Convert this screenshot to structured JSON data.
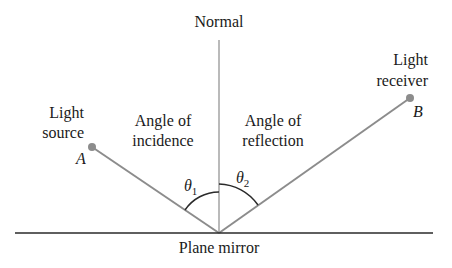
{
  "diagram": {
    "labels": {
      "normal": "Normal",
      "light_source_line1": "Light",
      "light_source_line2": "source",
      "point_a": "A",
      "angle_incidence_line1": "Angle of",
      "angle_incidence_line2": "incidence",
      "angle_reflection_line1": "Angle of",
      "angle_reflection_line2": "reflection",
      "light_receiver_line1": "Light",
      "light_receiver_line2": "receiver",
      "point_b": "B",
      "theta1": "θ",
      "theta1_sub": "1",
      "theta2": "θ",
      "theta2_sub": "2",
      "mirror": "Plane mirror"
    },
    "geometry": {
      "point_a": [
        92,
        147
      ],
      "point_b": [
        410,
        98
      ],
      "incidence_point": [
        219,
        233
      ],
      "normal_top": [
        219,
        40
      ],
      "mirror_left": [
        15,
        233
      ],
      "mirror_right": [
        433,
        233
      ]
    },
    "colors": {
      "ray": "#8c8c8c",
      "point": "#8c8c8c",
      "mirror": "#2a2a2a",
      "normal": "#8c8c8c",
      "arc": "#2a2a2a",
      "text": "#1a1a1a"
    }
  }
}
